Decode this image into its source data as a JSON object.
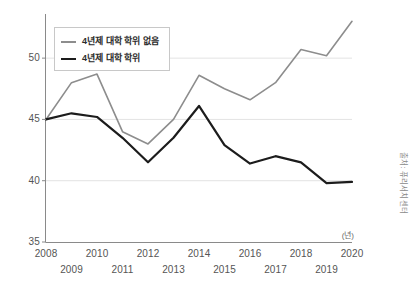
{
  "chart_data": {
    "type": "line",
    "title": "",
    "subtitle": "",
    "xlabel": "",
    "ylabel": "",
    "unit_label": "(년)",
    "source_label": "출처: 퓨리서치센터",
    "categories": [
      "2008",
      "2009",
      "2010",
      "2011",
      "2012",
      "2013",
      "2014",
      "2015",
      "2016",
      "2017",
      "2018",
      "2019",
      "2020"
    ],
    "x": [
      2008,
      2009,
      2010,
      2011,
      2012,
      2013,
      2014,
      2015,
      2016,
      2017,
      2018,
      2019,
      2020
    ],
    "xlim": [
      2008,
      2020
    ],
    "ylim": [
      35,
      53.6
    ],
    "yticks": [
      35,
      40,
      45,
      50
    ],
    "ytick_labels": [
      "35",
      "40",
      "45",
      "50"
    ],
    "grid": true,
    "grid_axis": "y",
    "legend_position": "top-left",
    "series": [
      {
        "name": "4년제 대학 학위 없음",
        "color": "#8d8d8d",
        "width": 1.6,
        "values": [
          45.0,
          48.0,
          48.7,
          44.0,
          43.0,
          45.0,
          48.6,
          47.5,
          46.6,
          48.0,
          50.7,
          50.2,
          53.0
        ]
      },
      {
        "name": "4년제 대학 학위",
        "color": "#1c1c1c",
        "width": 2.2,
        "values": [
          45.0,
          45.5,
          45.2,
          43.5,
          41.5,
          43.5,
          46.1,
          42.9,
          41.4,
          42.0,
          41.5,
          39.8,
          39.9
        ]
      }
    ]
  },
  "legend": {
    "items": [
      {
        "label": "4년제 대학 학위 없음",
        "color": "#8d8d8d"
      },
      {
        "label": "4년제 대학 학위",
        "color": "#1c1c1c"
      }
    ]
  },
  "axes": {
    "y_labels": [
      "50",
      "45",
      "40",
      "35"
    ],
    "x_labels_top": [
      "2008",
      "2010",
      "2012",
      "2014",
      "2016",
      "2018",
      "2020"
    ],
    "x_labels_bottom": [
      "2009",
      "2011",
      "2013",
      "2015",
      "2017",
      "2019"
    ]
  },
  "colors": {
    "series_gray": "#8d8d8d",
    "series_black": "#1c1c1c",
    "gridline": "#e3e3e3",
    "axis": "#8a8a8a",
    "text": "#555555"
  }
}
